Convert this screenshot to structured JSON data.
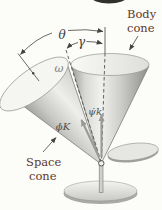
{
  "figure": {
    "labels": {
      "body_cone_line1": "Body",
      "body_cone_line2": "cone",
      "space_cone_line1": "Space",
      "space_cone_line2": "cone",
      "theta": "θ",
      "gamma": "γ",
      "omega": "ω",
      "precession_vector": "ϕ̇K",
      "spin_vector": "ψ̇k"
    },
    "colors": {
      "background": "#fcfcf9",
      "caption_text": "#5e392b",
      "dimension_line": "#45433f",
      "dashed_axis": "#55534f",
      "vector_arrow": "#9c9a96",
      "cone_highlight": "#f0f0ed",
      "cone_shadow": "#8a8a87"
    }
  }
}
